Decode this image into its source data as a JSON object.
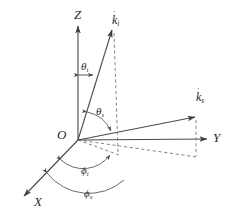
{
  "figure": {
    "background_color": "#ffffff",
    "line_color": "#4a4a4a",
    "dash_color": "#6f6f6f",
    "text_color": "#2b2b2b"
  },
  "axes": {
    "z": {
      "label": "Z",
      "description": "vertical axis"
    },
    "y": {
      "label": "Y",
      "description": "horizontal right axis"
    },
    "x": {
      "label": "X",
      "description": "axis toward lower left"
    },
    "origin": {
      "label": "O"
    }
  },
  "vectors": {
    "incident": {
      "label": "k",
      "subscript": "i",
      "accent": "˙"
    },
    "scattered": {
      "label": "k",
      "subscript": "s",
      "accent": "˙"
    }
  },
  "angles": {
    "theta_i": {
      "symbol": "θ",
      "subscript": "i"
    },
    "theta_s": {
      "symbol": "θ",
      "subscript": "s"
    },
    "phi_i": {
      "symbol": "ϕ",
      "subscript": "i"
    },
    "phi_s": {
      "symbol": "ϕ",
      "subscript": "s"
    }
  }
}
